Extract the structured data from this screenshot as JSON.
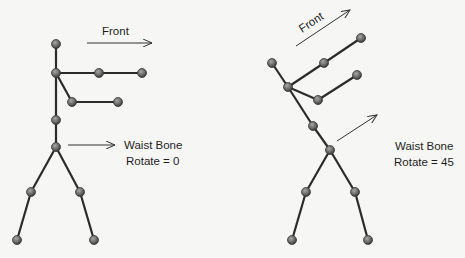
{
  "left_figure": {
    "front_label": "Front",
    "waist_label_line1": "Waist Bone",
    "waist_label_line2": "Rotate = 0"
  },
  "right_figure": {
    "front_label": "Front",
    "waist_label_line1": "Waist Bone",
    "waist_label_line2": "Rotate = 45"
  },
  "colors": {
    "bone": "#2b2b2b",
    "joint": "#6b6b6b",
    "background": "#f6f6f4"
  }
}
